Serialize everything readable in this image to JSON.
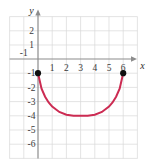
{
  "chart_data": {
    "type": "line",
    "title": "",
    "subtitle": "",
    "xlabel": "x",
    "ylabel": "y",
    "xlim": [
      -2,
      7
    ],
    "ylim": [
      -7,
      3
    ],
    "grid": true,
    "legend": null,
    "x_ticks": [
      -1,
      1,
      2,
      3,
      4,
      5,
      6
    ],
    "x_tick_labels": [
      "-1",
      "1",
      "2",
      "3",
      "4",
      "5",
      "6"
    ],
    "y_ticks": [
      2,
      1,
      -1,
      -2,
      -3,
      -4,
      -5,
      -6
    ],
    "y_tick_labels": [
      "2",
      "1",
      "-1",
      "-2",
      "-3",
      "-4",
      "-5",
      "-6"
    ],
    "series": [
      {
        "name": "curve",
        "color": "#cc2b52",
        "shape": "semicircle-opening-up",
        "center": [
          3,
          -1
        ],
        "radius": 3,
        "domain": [
          0,
          6
        ],
        "vertex": [
          3,
          -4
        ],
        "x": [
          0,
          0.25,
          0.5,
          0.75,
          1,
          1.5,
          2,
          2.5,
          3,
          3.5,
          4,
          4.5,
          5,
          5.25,
          5.5,
          5.75,
          6
        ],
        "y": [
          -1,
          -2.09,
          -2.66,
          -3.06,
          -3.35,
          -3.73,
          -3.92,
          -3.99,
          -4,
          -3.99,
          -3.92,
          -3.73,
          -3.35,
          -3.06,
          -2.66,
          -2.09,
          -1
        ]
      }
    ],
    "endpoints": [
      {
        "name": "left-endpoint",
        "x": 0,
        "y": -1,
        "filled": true,
        "color": "#111111"
      },
      {
        "name": "right-endpoint",
        "x": 6,
        "y": -1,
        "filled": true,
        "color": "#111111"
      }
    ],
    "colors": {
      "curve": "#cc2b52",
      "grid": "#d9d9d9",
      "axis": "#8c8c8c",
      "endpoint": "#111111",
      "label": "#3a3a3a",
      "background": "#ffffff"
    }
  }
}
